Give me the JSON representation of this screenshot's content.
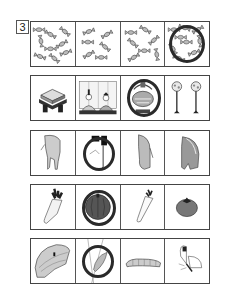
{
  "question_number": "3",
  "rows": [
    {
      "topic": "candy",
      "cells": [
        {
          "item": "candies-many",
          "circled": false
        },
        {
          "item": "candies-few",
          "circled": false
        },
        {
          "item": "candies-medium",
          "circled": false
        },
        {
          "item": "candies-cluster",
          "circled": true
        }
      ]
    },
    {
      "topic": "hina-matsuri",
      "cells": [
        {
          "item": "hishimochi-stand",
          "circled": false
        },
        {
          "item": "hina-dolls-folding-screen",
          "circled": false
        },
        {
          "item": "decorative-basket",
          "circled": true
        },
        {
          "item": "bonbori-lamps",
          "circled": false
        }
      ]
    },
    {
      "topic": "animal-rear-views",
      "cells": [
        {
          "item": "horse-rear",
          "circled": false
        },
        {
          "item": "animal-with-tail",
          "circled": true
        },
        {
          "item": "elephant-rear",
          "circled": false
        },
        {
          "item": "bear-rear",
          "circled": false
        }
      ]
    },
    {
      "topic": "vegetables",
      "cells": [
        {
          "item": "daikon-radish",
          "circled": false
        },
        {
          "item": "pumpkin",
          "circled": true
        },
        {
          "item": "carrot",
          "circled": false
        },
        {
          "item": "tomato",
          "circled": false
        }
      ]
    },
    {
      "topic": "butterfly-life-cycle",
      "cells": [
        {
          "item": "cabbage-leaf-with-egg",
          "circled": false
        },
        {
          "item": "chrysalis",
          "circled": true
        },
        {
          "item": "caterpillar",
          "circled": false
        },
        {
          "item": "butterfly",
          "circled": false
        }
      ]
    }
  ]
}
